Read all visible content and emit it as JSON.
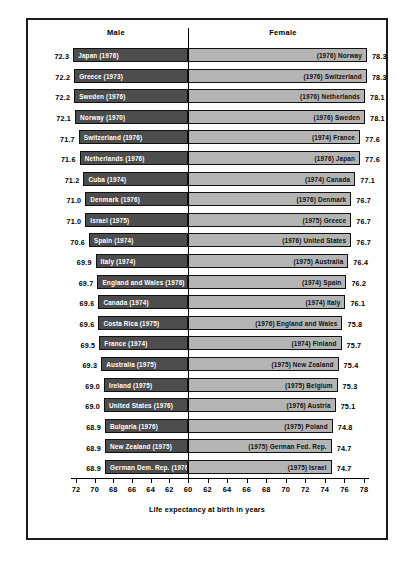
{
  "header": {
    "male_label": "Male",
    "female_label": "Female"
  },
  "axis": {
    "caption": "Life expectancy at birth in years",
    "tick_labels": [
      "72",
      "70",
      "68",
      "66",
      "64",
      "62",
      "60",
      "62",
      "64",
      "66",
      "68",
      "70",
      "72",
      "74",
      "76",
      "78"
    ]
  },
  "colors": {
    "male_bar": "#4d4d4d",
    "female_bar": "#b4b4b4",
    "bar_outline": "#111111",
    "frame": "#1c1c1c",
    "center_line": "#000000",
    "male_label_text": "#ffffff",
    "female_label_text": "#111111"
  },
  "chart_data": {
    "type": "bar",
    "title": "",
    "subtitle": "",
    "xlabel": "Life expectancy at birth in years",
    "ylabel": "",
    "orientation": "horizontal",
    "style": "bidirectional population pyramid",
    "grid": false,
    "legend": [
      "Male",
      "Female"
    ],
    "legend_position": "top",
    "axis_center_value": 60,
    "axis_left_ticks": [
      72,
      70,
      68,
      66,
      64,
      62,
      60
    ],
    "axis_right_ticks": [
      60,
      62,
      64,
      66,
      68,
      70,
      72,
      74,
      76,
      78
    ],
    "axis_left_range": [
      72,
      60
    ],
    "axis_right_range": [
      60,
      78
    ],
    "series": [
      {
        "name": "Male",
        "side": "left",
        "values": [
          72.3,
          72.2,
          72.2,
          72.1,
          71.7,
          71.6,
          71.2,
          71.0,
          71.0,
          70.6,
          69.9,
          69.7,
          69.6,
          69.6,
          69.5,
          69.3,
          69.0,
          69.0,
          68.9,
          68.9,
          68.9
        ],
        "labels": [
          "Japan (1976)",
          "Greece (1973)",
          "Sweden (1976)",
          "Norway (1970)",
          "Switzerland (1976)",
          "Netherlands (1976)",
          "Cuba (1974)",
          "Denmark (1976)",
          "Israel (1975)",
          "Spain (1974)",
          "Italy (1974)",
          "England and Wales (1976)",
          "Canada (1974)",
          "Costa Rica (1975)",
          "France (1974)",
          "Australia (1975)",
          "Ireland (1975)",
          "United States (1976)",
          "Bulgaria (1976)",
          "New Zealand (1975)",
          "German Dem. Rep. (1976)"
        ]
      },
      {
        "name": "Female",
        "side": "right",
        "values": [
          78.3,
          78.3,
          78.1,
          78.1,
          77.6,
          77.6,
          77.1,
          76.7,
          76.7,
          76.7,
          76.4,
          76.2,
          76.1,
          75.8,
          75.7,
          75.4,
          75.3,
          75.1,
          74.8,
          74.7,
          74.7
        ],
        "labels": [
          "(1976) Norway",
          "(1976) Switzerland",
          "(1976) Netherlands",
          "(1976) Sweden",
          "(1974) France",
          "(1976) Japan",
          "(1974) Canada",
          "(1976) Denmark",
          "(1975) Greece",
          "(1976) United States",
          "(1975) Australia",
          "(1974) Spain",
          "(1974) Italy",
          "(1976) England and Wales",
          "(1974) Finland",
          "(1975) New Zealand",
          "(1975) Belgium",
          "(1976) Austria",
          "(1975) Poland",
          "(1975) German Fed. Rep.",
          "(1975) Israel"
        ]
      }
    ],
    "rows": [
      {
        "male_value": "72.3",
        "male_label": "Japan (1976)",
        "female_label": "(1976) Norway",
        "female_value": "78.3"
      },
      {
        "male_value": "72.2",
        "male_label": "Greece (1973)",
        "female_label": "(1976) Switzerland",
        "female_value": "78.3"
      },
      {
        "male_value": "72.2",
        "male_label": "Sweden (1976)",
        "female_label": "(1976) Netherlands",
        "female_value": "78.1"
      },
      {
        "male_value": "72.1",
        "male_label": "Norway (1970)",
        "female_label": "(1976) Sweden",
        "female_value": "78.1"
      },
      {
        "male_value": "71.7",
        "male_label": "Switzerland (1976)",
        "female_label": "(1974) France",
        "female_value": "77.6"
      },
      {
        "male_value": "71.6",
        "male_label": "Netherlands (1976)",
        "female_label": "(1976) Japan",
        "female_value": "77.6"
      },
      {
        "male_value": "71.2",
        "male_label": "Cuba (1974)",
        "female_label": "(1974) Canada",
        "female_value": "77.1"
      },
      {
        "male_value": "71.0",
        "male_label": "Denmark (1976)",
        "female_label": "(1976) Denmark",
        "female_value": "76.7"
      },
      {
        "male_value": "71.0",
        "male_label": "Israel (1975)",
        "female_label": "(1975) Greece",
        "female_value": "76.7"
      },
      {
        "male_value": "70.6",
        "male_label": "Spain (1974)",
        "female_label": "(1976) United States",
        "female_value": "76.7"
      },
      {
        "male_value": "69.9",
        "male_label": "Italy (1974)",
        "female_label": "(1975) Australia",
        "female_value": "76.4"
      },
      {
        "male_value": "69.7",
        "male_label": "England and Wales (1976)",
        "female_label": "(1974) Spain",
        "female_value": "76.2"
      },
      {
        "male_value": "69.6",
        "male_label": "Canada (1974)",
        "female_label": "(1974) Italy",
        "female_value": "76.1"
      },
      {
        "male_value": "69.6",
        "male_label": "Costa Rica (1975)",
        "female_label": "(1976) England and Wales",
        "female_value": "75.8"
      },
      {
        "male_value": "69.5",
        "male_label": "France (1974)",
        "female_label": "(1974) Finland",
        "female_value": "75.7"
      },
      {
        "male_value": "69.3",
        "male_label": "Australia (1975)",
        "female_label": "(1975) New Zealand",
        "female_value": "75.4"
      },
      {
        "male_value": "69.0",
        "male_label": "Ireland (1975)",
        "female_label": "(1975) Belgium",
        "female_value": "75.3"
      },
      {
        "male_value": "69.0",
        "male_label": "United States (1976)",
        "female_label": "(1976) Austria",
        "female_value": "75.1"
      },
      {
        "male_value": "68.9",
        "male_label": "Bulgaria (1976)",
        "female_label": "(1975) Poland",
        "female_value": "74.8"
      },
      {
        "male_value": "68.9",
        "male_label": "New Zealand (1975)",
        "female_label": "(1975) German Fed. Rep.",
        "female_value": "74.7"
      },
      {
        "male_value": "68.9",
        "male_label": "German Dem. Rep. (1976)",
        "female_label": "(1975) Israel",
        "female_value": "74.7"
      }
    ]
  }
}
